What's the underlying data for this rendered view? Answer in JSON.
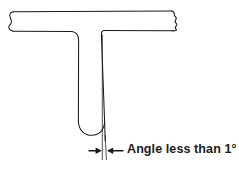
{
  "figure": {
    "background_color": "#ffffff",
    "line_color": "#1a1a1a",
    "parts": {
      "flange": {
        "name": "horizontal-flange",
        "break_symbol_left": "bracket-break",
        "break_symbol_right": "zigzag-break"
      },
      "web": {
        "name": "vertical-web",
        "bottom_shape": "rounded-u"
      },
      "reference_line": {
        "name": "vertical-reference-line",
        "style": "thin-solid"
      },
      "draft_line": {
        "name": "tapered-draft-line",
        "style": "thin-solid"
      }
    },
    "dimension": {
      "marker": "double-arrow-inward",
      "arrow_left_label": "left-dimension-arrow",
      "arrow_right_label": "right-dimension-arrow"
    },
    "annotation": {
      "text": "Angle less than 1",
      "degree_symbol": "°",
      "full_text": "Angle less than 1°"
    }
  }
}
